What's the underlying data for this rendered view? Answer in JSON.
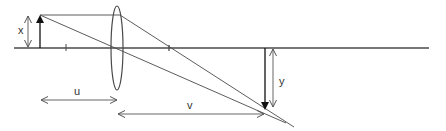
{
  "diagram": {
    "labels": {
      "object_height": "x",
      "image_height": "y",
      "object_distance": "u",
      "image_distance": "v"
    },
    "colors": {
      "line": "#4a4a4a",
      "arrow": "#111111",
      "dim": "#555555"
    }
  }
}
